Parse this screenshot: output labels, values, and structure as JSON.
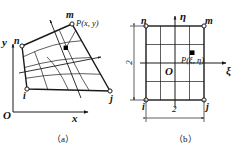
{
  "figure": {
    "stroke_color": "#1a1a1a",
    "node_fill": "#ffffff",
    "point_fill": "#000000",
    "background": "#ffffff"
  },
  "panel_a": {
    "caption": "（a）",
    "space": "physical",
    "axes": {
      "origin_label": "O",
      "x_label": "x",
      "y_label": "y"
    },
    "nodes": [
      {
        "id": "i",
        "label": "i",
        "x": 27,
        "y": 89
      },
      {
        "id": "j",
        "label": "j",
        "x": 110,
        "y": 91
      },
      {
        "id": "m",
        "label": "m",
        "x": 72,
        "y": 24
      },
      {
        "id": "n",
        "label": "n",
        "x": 22,
        "y": 46
      }
    ],
    "interior_point": {
      "label": "P(x, y)",
      "x": 66,
      "y": 48
    },
    "grid_divisions": 4,
    "direction_arrows": 2
  },
  "panel_b": {
    "caption": "（b）",
    "space": "natural",
    "axes": {
      "origin_label": "O",
      "xi_label": "ξ",
      "eta_label": "η"
    },
    "nodes": [
      {
        "id": "i",
        "label": "i",
        "x": 146,
        "y": 100
      },
      {
        "id": "j",
        "label": "j",
        "x": 204,
        "y": 100
      },
      {
        "id": "m",
        "label": "m",
        "x": 204,
        "y": 26
      },
      {
        "id": "n",
        "label": "n",
        "x": 146,
        "y": 26
      }
    ],
    "interior_point": {
      "label": "P(ξ, η)",
      "x": 182,
      "y": 53
    },
    "grid_divisions": 4,
    "dimensions": [
      {
        "id": "width",
        "label": "2",
        "orientation": "horizontal"
      },
      {
        "id": "height",
        "label": "2",
        "orientation": "vertical"
      }
    ]
  }
}
